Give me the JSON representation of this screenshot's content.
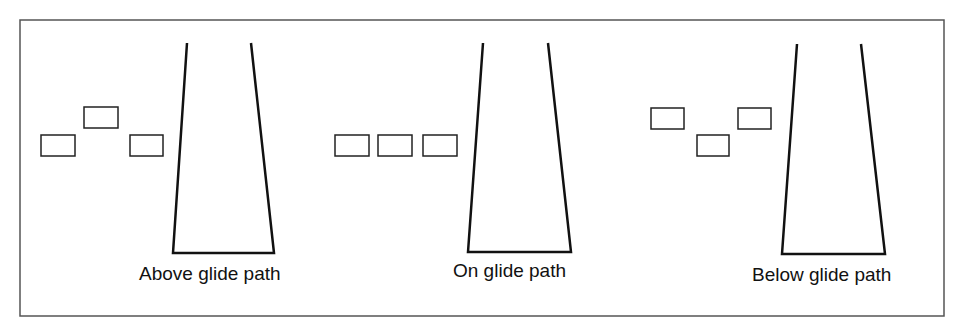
{
  "title": "",
  "panels": [
    {
      "label": "Above glide path",
      "lights": [
        {
          "x": 41,
          "y": 135
        },
        {
          "x": 84,
          "y": 107
        },
        {
          "x": 130,
          "y": 135
        }
      ],
      "runway": {
        "tl": [
          187,
          43
        ],
        "tr": [
          251,
          43
        ],
        "bl": [
          173,
          253
        ],
        "br": [
          274,
          253
        ]
      }
    },
    {
      "label": "On glide path",
      "lights": [
        {
          "x": 335,
          "y": 135
        },
        {
          "x": 378,
          "y": 135
        },
        {
          "x": 423,
          "y": 135
        }
      ],
      "runway": {
        "tl": [
          483,
          43
        ],
        "tr": [
          548,
          43
        ],
        "bl": [
          468,
          252
        ],
        "br": [
          571,
          252
        ]
      }
    },
    {
      "label": "Below glide path",
      "lights": [
        {
          "x": 651,
          "y": 108
        },
        {
          "x": 697,
          "y": 135
        },
        {
          "x": 738,
          "y": 108
        }
      ],
      "runway": {
        "tl": [
          797,
          44
        ],
        "tr": [
          861,
          44
        ],
        "bl": [
          782,
          254
        ],
        "br": [
          885,
          254
        ]
      }
    }
  ],
  "colors": {
    "stroke": "#111111",
    "frame": "#555555",
    "background": "#ffffff"
  }
}
